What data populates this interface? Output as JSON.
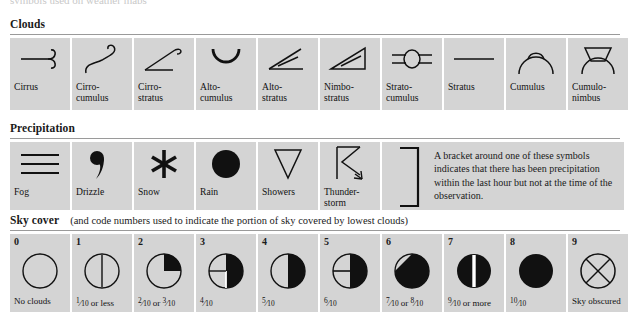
{
  "top_partial_text": "symbols used on weather maps",
  "clouds": {
    "title": "Clouds",
    "items": [
      {
        "label": "Cirrus",
        "icon": "cirrus-icon"
      },
      {
        "label": "Cirro-\ncumulus",
        "icon": "cirrocumulus-icon"
      },
      {
        "label": "Cirro-\nstratus",
        "icon": "cirrostratus-icon"
      },
      {
        "label": "Alto-\ncumulus",
        "icon": "altocumulus-icon"
      },
      {
        "label": "Alto-\nstratus",
        "icon": "altostratus-icon"
      },
      {
        "label": "Nimbo-\nstratus",
        "icon": "nimbostratus-icon"
      },
      {
        "label": "Strato-\ncumulus",
        "icon": "stratocumulus-icon"
      },
      {
        "label": "Stratus",
        "icon": "stratus-icon"
      },
      {
        "label": "Cumulus",
        "icon": "cumulus-icon"
      },
      {
        "label": "Cumulo-\nnimbus",
        "icon": "cumulonimbus-icon"
      }
    ]
  },
  "precipitation": {
    "title": "Precipitation",
    "items": [
      {
        "label": "Fog",
        "icon": "fog-icon"
      },
      {
        "label": "Drizzle",
        "icon": "drizzle-icon"
      },
      {
        "label": "Snow",
        "icon": "snow-icon"
      },
      {
        "label": "Rain",
        "icon": "rain-icon"
      },
      {
        "label": "Showers",
        "icon": "showers-icon"
      },
      {
        "label": "Thunder-\nstorm",
        "icon": "thunderstorm-icon"
      }
    ],
    "bracket_note": "A bracket around one of these symbols indicates that there has been precipitation within the last hour but not at the time of the observation."
  },
  "sky_cover": {
    "title": "Sky cover",
    "note": "(and code numbers used to indicate the portion of sky covered by lowest clouds)",
    "items": [
      {
        "code": "0",
        "label": "No clouds",
        "icon": "sky-0-icon"
      },
      {
        "code": "1",
        "label": "1/10 or less",
        "icon": "sky-1-icon"
      },
      {
        "code": "2",
        "label": "2/10 or 3/10",
        "icon": "sky-2-icon"
      },
      {
        "code": "3",
        "label": "4/10",
        "icon": "sky-3-icon"
      },
      {
        "code": "4",
        "label": "5/10",
        "icon": "sky-4-icon"
      },
      {
        "code": "5",
        "label": "6/10",
        "icon": "sky-5-icon"
      },
      {
        "code": "6",
        "label": "7/10 or 8/10",
        "icon": "sky-6-icon"
      },
      {
        "code": "7",
        "label": "9/10 or more",
        "icon": "sky-7-icon"
      },
      {
        "code": "8",
        "label": "10/10",
        "icon": "sky-8-icon"
      },
      {
        "code": "9",
        "label": "Sky obscured",
        "icon": "sky-9-icon"
      }
    ]
  },
  "colors": {
    "cell_background": "#d4d4d4",
    "page_background": "#ffffff",
    "ink": "#111111",
    "rule": "#9a9a9a"
  }
}
